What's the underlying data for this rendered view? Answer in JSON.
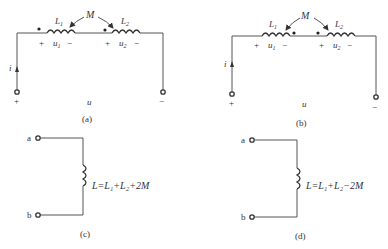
{
  "figures": {
    "a": {
      "caption": "(a)",
      "mutual": "M",
      "L1": "L",
      "L1_sub": "1",
      "L2": "L",
      "L2_sub": "2",
      "u1": "u",
      "u1_sub": "1",
      "u2": "u",
      "u2_sub": "2",
      "plus": "+",
      "minus": "−",
      "current": "i",
      "voltage": "u",
      "dots": "same-side (left of each coil)"
    },
    "b": {
      "caption": "(b)",
      "mutual": "M",
      "L1": "L",
      "L1_sub": "1",
      "L2": "L",
      "L2_sub": "2",
      "u1": "u",
      "u1_sub": "1",
      "u2": "u",
      "u2_sub": "2",
      "plus": "+",
      "minus": "−",
      "current": "i",
      "voltage": "u",
      "dots": "opposite (right of L1, left of L2)"
    },
    "c": {
      "caption": "(c)",
      "terminal_a": "a",
      "terminal_b": "b",
      "formula": "L=L₁+L₂+2M"
    },
    "d": {
      "caption": "(d)",
      "terminal_a": "a",
      "terminal_b": "b",
      "formula": "L=L₁+L₂−2M"
    }
  }
}
